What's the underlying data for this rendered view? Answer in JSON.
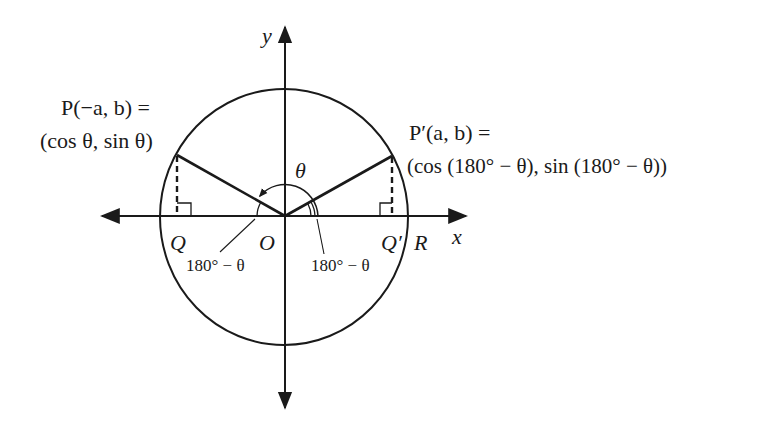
{
  "diagram": {
    "axes": {
      "x_label": "x",
      "y_label": "y"
    },
    "points": {
      "P": {
        "label": "P(−a, b) =",
        "coords": "(cos θ, sin θ)"
      },
      "P_prime": {
        "label": "P′(a, b) =",
        "coords": "(cos (180° − θ), sin (180° − θ))"
      },
      "Q": "Q",
      "O": "O",
      "Q_prime": "Q′",
      "R": "R"
    },
    "angles": {
      "theta": "θ",
      "left_ref": "180° − θ",
      "right_ref": "180° − θ"
    },
    "colors": {
      "stroke": "#1a1a1a",
      "background": "#ffffff"
    }
  }
}
